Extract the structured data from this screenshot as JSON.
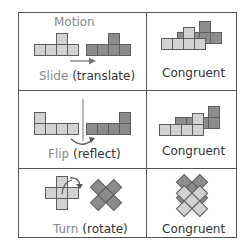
{
  "rows": [
    {
      "motion_header": "Motion",
      "motion_word": "Slide",
      "motion_term": "(translate)",
      "result": "Congruent"
    },
    {
      "motion_word": "Flip",
      "motion_term": "(reflect)",
      "result": "Congruent"
    },
    {
      "motion_word": "Turn",
      "motion_term": "(rotate)",
      "result": "Congruent"
    }
  ],
  "colors": {
    "light_square": "#d2d2d2",
    "dark_square": "#8c8c8c",
    "square_border": "#5e5e5e",
    "grid_line": "#555555",
    "accent_text": "#888888"
  }
}
